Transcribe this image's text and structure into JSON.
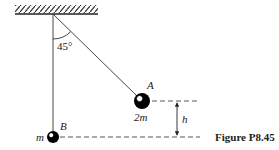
{
  "figure": {
    "caption": "Figure P8.45",
    "angle_label": "45°",
    "ball_a": {
      "label": "A",
      "mass_label": "2m"
    },
    "ball_b": {
      "label": "B",
      "mass_label": "m"
    },
    "height_label": "h",
    "colors": {
      "ink": "#222222",
      "ball": "#000000",
      "background": "#ffffff"
    }
  }
}
